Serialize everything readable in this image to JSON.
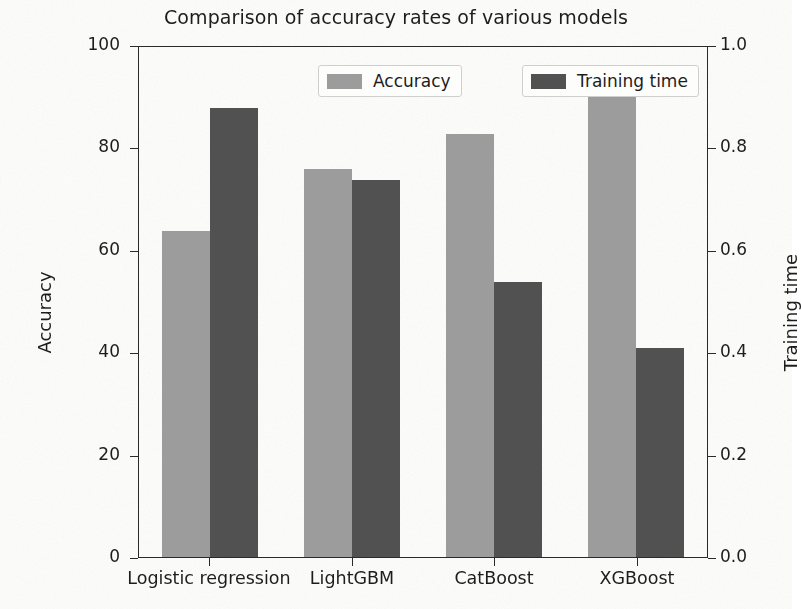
{
  "chart_data": {
    "type": "bar",
    "title": "Comparison of accuracy rates of various models",
    "xlabel": "",
    "ylabel": "Accuracy",
    "y2label": "Training time",
    "categories": [
      "Logistic regression",
      "LightGBM",
      "CatBoost",
      "XGBoost"
    ],
    "series": [
      {
        "name": "Accuracy",
        "axis": "left",
        "color": "#9c9c9c",
        "values": [
          64,
          76,
          83,
          91
        ]
      },
      {
        "name": "Training time",
        "axis": "right",
        "color": "#515151",
        "values": [
          0.88,
          0.74,
          0.54,
          0.41
        ]
      }
    ],
    "ylim": [
      0,
      100
    ],
    "y2lim": [
      0.0,
      1.0
    ],
    "yticks": [
      "0",
      "20",
      "40",
      "60",
      "80",
      "100"
    ],
    "ytick_values": [
      0,
      20,
      40,
      60,
      80,
      100
    ],
    "y2ticks": [
      "0.0",
      "0.2",
      "0.4",
      "0.6",
      "0.8",
      "1.0"
    ],
    "y2tick_values": [
      0.0,
      0.2,
      0.4,
      0.6,
      0.8,
      1.0
    ],
    "grid": false,
    "legend_position": "upper center",
    "legend": [
      "Accuracy",
      "Training time"
    ],
    "background_color": "#fdfdfc",
    "axis_color": "#2a2a2a"
  }
}
